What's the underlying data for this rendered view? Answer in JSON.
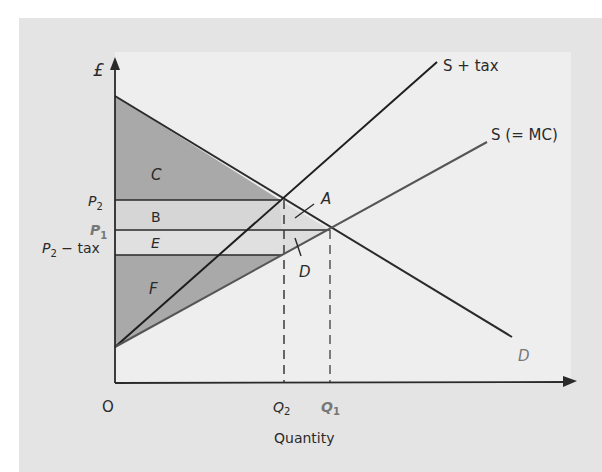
{
  "diagram": {
    "title": "",
    "y_axis_label": "£",
    "x_axis_label": "Quantity",
    "origin_label": "O",
    "curves": {
      "supply_plus_tax": "S + tax",
      "supply": "S (= MC)",
      "demand": "D"
    },
    "price_labels": {
      "p2": "P",
      "p2_sub": "2",
      "p1": "P",
      "p1_sub": "1",
      "p2_minus_tax": "P",
      "p2_minus_tax_sub": "2",
      "p2_minus_tax_suffix": " − tax"
    },
    "quantity_labels": {
      "q2": "Q",
      "q2_sub": "2",
      "q1": "Q",
      "q1_sub": "1"
    },
    "area_labels": {
      "A": "A",
      "B": "B",
      "C": "C",
      "D": "D",
      "E": "E",
      "F": "F"
    },
    "colors": {
      "frame": "#e4e4e4",
      "plot_bg": "#eeeeee",
      "dark_shade": "#a9a9a9",
      "light_shade": "#d6d6d6",
      "line": "#2a2a2a",
      "supply_line": "#555555",
      "faded_label": "#777777"
    }
  }
}
